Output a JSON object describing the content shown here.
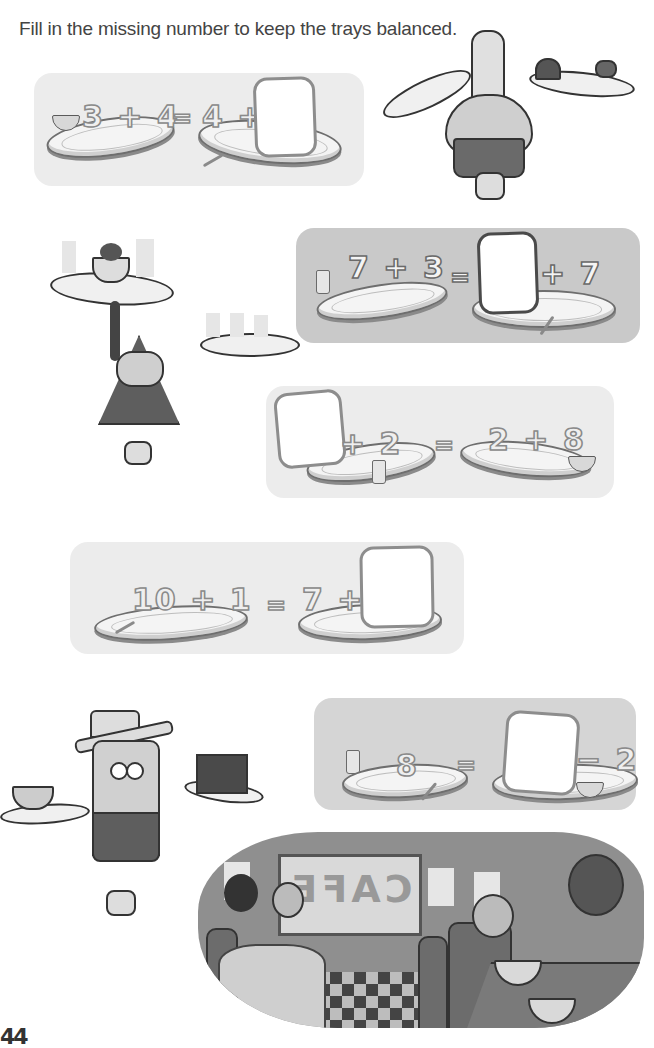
{
  "page": {
    "instruction": "Fill in the missing number to keep the trays balanced.",
    "page_number": "44"
  },
  "problems": [
    {
      "id": 1,
      "left": "3 + 4",
      "equals": "=",
      "right_prefix": "4 +",
      "right_suffix": "",
      "missing": "answer-box",
      "items": [
        "bowl",
        "spoon"
      ]
    },
    {
      "id": 2,
      "left": "7 + 3",
      "equals": "=",
      "right_prefix": "",
      "right_suffix": "+ 7",
      "missing": "answer-box",
      "items": [
        "glass",
        "spoon"
      ]
    },
    {
      "id": 3,
      "left_prefix": "",
      "left_suffix": "+ 2",
      "equals": "=",
      "right": "2 + 8",
      "missing": "answer-box",
      "items": [
        "glass",
        "bowl"
      ]
    },
    {
      "id": 4,
      "left": "10 + 1",
      "equals": "=",
      "right_prefix": "7 +",
      "right_suffix": "",
      "missing": "answer-box",
      "items": [
        "spoon"
      ]
    },
    {
      "id": 5,
      "left": "8",
      "equals": "=",
      "right_prefix": "",
      "right_suffix": "− 2",
      "missing": "answer-box",
      "items": [
        "glass",
        "spoon",
        "bowl"
      ]
    }
  ],
  "illustrations": {
    "chef": "chef-with-trays",
    "waiter_triangle": "triangle-waiter-with-sundae-and-drinks",
    "waiter_tall": "tall-waiter-with-soup-and-cake",
    "cafe_scene": {
      "sign_text": "CAFE"
    }
  }
}
